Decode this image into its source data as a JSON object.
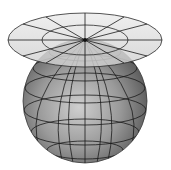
{
  "diagram": {
    "elements": [
      {
        "name": "projection-plane",
        "shape": "ellipse disk tangent at pole",
        "rings": 2,
        "radial_lines": 12
      },
      {
        "name": "globe",
        "shape": "sphere with graticule",
        "parallels": 5,
        "meridians": 9
      }
    ],
    "colors": {
      "background": "#ffffff",
      "plane_fill": "#d9d9d9",
      "globe_light": "#c8c8c8",
      "globe_dark": "#5a5a5a",
      "lines": "#1a1a1a"
    }
  }
}
